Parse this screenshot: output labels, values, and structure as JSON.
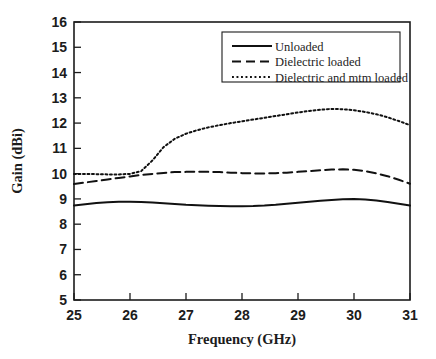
{
  "chart_data": {
    "type": "line",
    "title": "",
    "xlabel": "Frequency (GHz)",
    "ylabel": "Gain (dBi)",
    "xlim": [
      25,
      31
    ],
    "ylim": [
      5,
      16
    ],
    "xticks": [
      "25",
      "26",
      "27",
      "28",
      "29",
      "30",
      "31"
    ],
    "yticks": [
      "5",
      "6",
      "7",
      "8",
      "9",
      "10",
      "11",
      "12",
      "13",
      "14",
      "15",
      "16"
    ],
    "grid": false,
    "legend_position": "upper right",
    "x": [
      25.0,
      25.2,
      25.4,
      25.6,
      25.8,
      26.0,
      26.2,
      26.4,
      26.6,
      26.8,
      27.0,
      27.2,
      27.4,
      27.6,
      27.8,
      28.0,
      28.2,
      28.4,
      28.6,
      28.8,
      29.0,
      29.2,
      29.4,
      29.6,
      29.8,
      30.0,
      30.2,
      30.4,
      30.6,
      30.8,
      31.0
    ],
    "series": [
      {
        "name": "Unloaded",
        "style": "solid",
        "values": [
          8.74,
          8.79,
          8.84,
          8.87,
          8.89,
          8.89,
          8.88,
          8.86,
          8.83,
          8.8,
          8.77,
          8.75,
          8.73,
          8.72,
          8.71,
          8.71,
          8.72,
          8.74,
          8.77,
          8.81,
          8.85,
          8.89,
          8.93,
          8.96,
          8.99,
          9.0,
          8.98,
          8.94,
          8.88,
          8.81,
          8.74
        ]
      },
      {
        "name": "Dielectric loaded",
        "style": "dashed",
        "values": [
          9.59,
          9.65,
          9.71,
          9.77,
          9.83,
          9.89,
          9.95,
          9.99,
          10.03,
          10.06,
          10.07,
          10.08,
          10.07,
          10.06,
          10.04,
          10.02,
          10.01,
          10.01,
          10.02,
          10.04,
          10.07,
          10.1,
          10.13,
          10.16,
          10.17,
          10.15,
          10.1,
          10.01,
          9.9,
          9.76,
          9.6
        ]
      },
      {
        "name": "Dielectric and mtm loaded",
        "style": "dotted",
        "values": [
          9.99,
          9.99,
          9.98,
          9.97,
          9.97,
          9.99,
          10.1,
          10.52,
          11.05,
          11.38,
          11.58,
          11.72,
          11.83,
          11.92,
          12.0,
          12.07,
          12.14,
          12.21,
          12.28,
          12.35,
          12.42,
          12.48,
          12.53,
          12.56,
          12.55,
          12.51,
          12.44,
          12.35,
          12.23,
          12.08,
          11.92
        ]
      }
    ]
  },
  "legend": {
    "entries": [
      {
        "label": "Unloaded",
        "style": "solid"
      },
      {
        "label": "Dielectric loaded",
        "style": "dashed"
      },
      {
        "label": "Dielectric and mtm loaded",
        "style": "dotted"
      }
    ]
  },
  "colors": {
    "background": "#ffffff",
    "axis": "#1c1c1c",
    "line": "#111111"
  }
}
